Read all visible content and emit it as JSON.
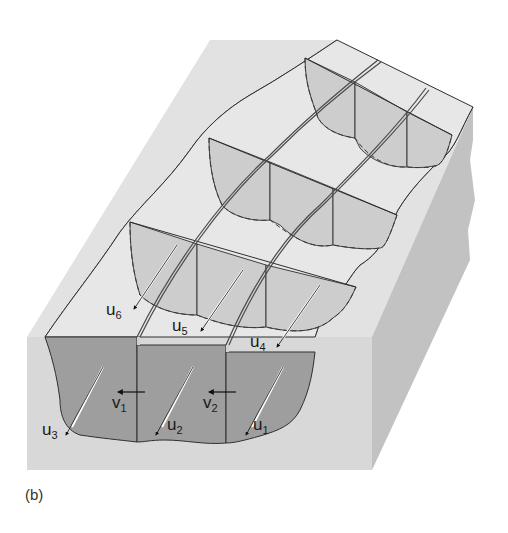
{
  "figure": {
    "caption": "(b)",
    "colors": {
      "background": "#ffffff",
      "block_front": "#d9d9d9",
      "block_side": "#c4c4c4",
      "top_surface": "#e3e3e3",
      "ice_section": "#9d9d9d",
      "ice_inner_face": "#cacaca",
      "ice_top": "#e6e6e6",
      "line": "#2f2f2f"
    },
    "labels": {
      "u1": {
        "base": "u",
        "sub": "1"
      },
      "u2": {
        "base": "u",
        "sub": "2"
      },
      "u3": {
        "base": "u",
        "sub": "3"
      },
      "u4": {
        "base": "u",
        "sub": "4"
      },
      "u5": {
        "base": "u",
        "sub": "5"
      },
      "u6": {
        "base": "u",
        "sub": "6"
      },
      "v1": {
        "base": "v",
        "sub": "1"
      },
      "v2": {
        "base": "v",
        "sub": "2"
      }
    }
  }
}
